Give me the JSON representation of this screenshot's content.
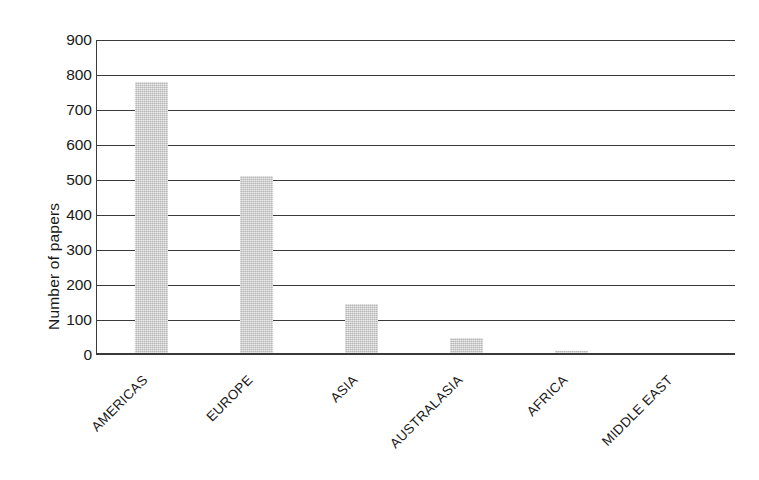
{
  "chart_data": {
    "type": "bar",
    "title": "",
    "subtitle": "",
    "xlabel": "",
    "ylabel": "Number of papers",
    "categories": [
      "AMERICAS",
      "EUROPE",
      "ASIA",
      "AUSTRALASIA",
      "AFRICA",
      "MIDDLE EAST"
    ],
    "values": [
      780,
      512,
      145,
      50,
      12,
      6
    ],
    "series": [
      {
        "name": "Number of papers",
        "values": [
          780,
          512,
          145,
          50,
          12,
          6
        ]
      }
    ],
    "ylim": [
      0,
      900
    ],
    "ytick_step": 100,
    "yticks": [
      0,
      100,
      200,
      300,
      400,
      500,
      600,
      700,
      800,
      900
    ],
    "ytick_labels": [
      "0",
      "100",
      "200",
      "300",
      "400",
      "500",
      "600",
      "700",
      "800",
      "900"
    ],
    "grid": "horizontal",
    "legend": "none",
    "xtick_label_rotation_degrees": -45,
    "bar_color": "#c9c9c9",
    "axis_color": "#3a3a3a",
    "background_color": "#ffffff"
  }
}
